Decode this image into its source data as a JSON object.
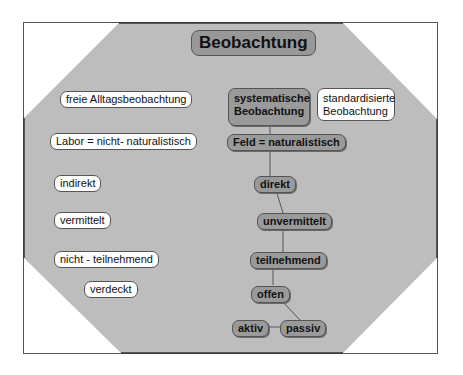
{
  "title": "Beobachtung",
  "colors": {
    "octagon_fill": "#bdbdbd",
    "node_gray": "#9a9a9a",
    "node_white": "#ffffff",
    "border": "#555555"
  },
  "left_column": [
    "freie Alltagsbeobachtung",
    "Labor = nicht- naturalistisch",
    "indirekt",
    "vermittelt",
    "nicht - teilnehmend",
    "verdeckt"
  ],
  "right_column": {
    "systematic": [
      "systematische",
      "Beobachtung"
    ],
    "standardized": [
      "standardisierte",
      "Beobachtung"
    ],
    "chain": [
      "Feld = naturalistisch",
      "direkt",
      "unvermittelt",
      "teilnehmend",
      "offen"
    ],
    "leaves": [
      "aktiv",
      "passiv"
    ]
  }
}
